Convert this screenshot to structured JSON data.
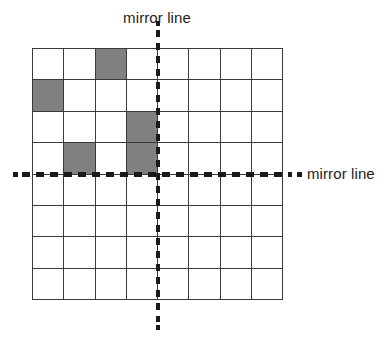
{
  "figure": {
    "type": "reflection-symmetry-grid",
    "grid": {
      "columns": 8,
      "rows": 8,
      "cell_border_color": "#3a3a3a",
      "cell_fill_color": "#ffffff",
      "shaded_fill_color": "#808080",
      "shaded_cells": [
        {
          "row": 1,
          "col": 3
        },
        {
          "row": 2,
          "col": 1
        },
        {
          "row": 3,
          "col": 4
        },
        {
          "row": 4,
          "col": 2
        },
        {
          "row": 4,
          "col": 4
        }
      ],
      "cells": [
        [
          0,
          0,
          1,
          0,
          0,
          0,
          0,
          0
        ],
        [
          1,
          0,
          0,
          0,
          0,
          0,
          0,
          0
        ],
        [
          0,
          0,
          0,
          1,
          0,
          0,
          0,
          0
        ],
        [
          0,
          1,
          0,
          1,
          0,
          0,
          0,
          0
        ],
        [
          0,
          0,
          0,
          0,
          0,
          0,
          0,
          0
        ],
        [
          0,
          0,
          0,
          0,
          0,
          0,
          0,
          0
        ],
        [
          0,
          0,
          0,
          0,
          0,
          0,
          0,
          0
        ],
        [
          0,
          0,
          0,
          0,
          0,
          0,
          0,
          0
        ]
      ]
    },
    "mirror_lines": {
      "vertical": {
        "label": "mirror line",
        "position_between_columns": "4 and 5",
        "style": "dashed",
        "color": "#1a1a1a"
      },
      "horizontal": {
        "label": "mirror line",
        "position_between_rows": "4 and 5",
        "style": "dashed",
        "color": "#1a1a1a"
      }
    }
  }
}
